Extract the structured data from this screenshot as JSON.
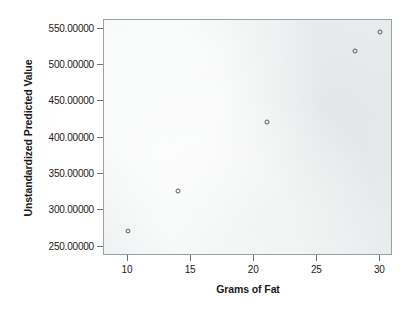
{
  "chart_data": {
    "type": "scatter",
    "title": "",
    "xlabel": "Grams of Fat",
    "ylabel": "Unstandardized Predicted Value",
    "xlim": [
      8.1,
      31.0
    ],
    "ylim": [
      237.0,
      562.0
    ],
    "grid": false,
    "legend": null,
    "x_ticks": [
      {
        "value": 10,
        "label": "10"
      },
      {
        "value": 15,
        "label": "15"
      },
      {
        "value": 20,
        "label": "20"
      },
      {
        "value": 25,
        "label": "25"
      },
      {
        "value": 30,
        "label": "30"
      }
    ],
    "y_ticks": [
      {
        "value": 250,
        "label": "250.00000"
      },
      {
        "value": 300,
        "label": "300.00000"
      },
      {
        "value": 350,
        "label": "350.00000"
      },
      {
        "value": 400,
        "label": "400.00000"
      },
      {
        "value": 450,
        "label": "450.00000"
      },
      {
        "value": 500,
        "label": "500.00000"
      },
      {
        "value": 550,
        "label": "550.00000"
      }
    ],
    "points": [
      {
        "x": 10,
        "y": 272
      },
      {
        "x": 14,
        "y": 327
      },
      {
        "x": 21,
        "y": 422
      },
      {
        "x": 28,
        "y": 519
      },
      {
        "x": 30,
        "y": 545
      }
    ],
    "marker": "open-circle",
    "marker_color": "#55595c",
    "plot_background": "#eceff0",
    "page_background": "#ffffff"
  }
}
